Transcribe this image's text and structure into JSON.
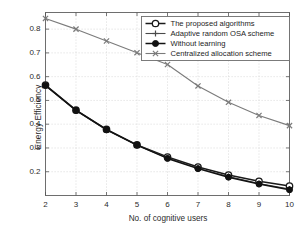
{
  "chart_data": {
    "type": "line",
    "title": "",
    "xlabel": "No. of cognitive users",
    "ylabel": "Energy Efficiency",
    "x": [
      2,
      3,
      4,
      5,
      6,
      7,
      8,
      9,
      10
    ],
    "xlim": [
      2,
      10
    ],
    "ylim": [
      0.1,
      0.87
    ],
    "xticks": [
      "2",
      "3",
      "4",
      "5",
      "6",
      "7",
      "8",
      "9",
      "10"
    ],
    "yticks": [
      "0.2",
      "0.3",
      "0.4",
      "0.5",
      "0.6",
      "0.7",
      "0.8"
    ],
    "grid": true,
    "legend_position": "top-right",
    "series": [
      {
        "name": "The proposed algorithms",
        "marker": "open-circle",
        "color": "#1a1a1a",
        "values": [
          0.565,
          0.459,
          0.378,
          0.313,
          0.262,
          0.22,
          0.186,
          0.16,
          0.14
        ]
      },
      {
        "name": "Adaptive random OSA scheme",
        "marker": "plus",
        "color": "#4a4a4a",
        "values": [
          0.562,
          0.457,
          0.376,
          0.311,
          0.258,
          0.215,
          0.18,
          0.15,
          0.127
        ]
      },
      {
        "name": "Without learning",
        "marker": "filled-circle",
        "color": "#111111",
        "values": [
          0.563,
          0.458,
          0.377,
          0.312,
          0.256,
          0.213,
          0.177,
          0.148,
          0.124
        ]
      },
      {
        "name": "Centralized allocation scheme",
        "marker": "x",
        "color": "#7b7b7b",
        "values": [
          0.845,
          0.8,
          0.75,
          0.701,
          0.651,
          0.561,
          0.492,
          0.437,
          0.394
        ]
      }
    ]
  },
  "axes": {
    "xlabel": "No. of cognitive users",
    "ylabel": "Energy Efficiency"
  },
  "legend": {
    "items": [
      {
        "label": "The proposed algorithms"
      },
      {
        "label": "Adaptive random OSA scheme"
      },
      {
        "label": "Without learning"
      },
      {
        "label": "Centralized allocation scheme"
      }
    ]
  }
}
